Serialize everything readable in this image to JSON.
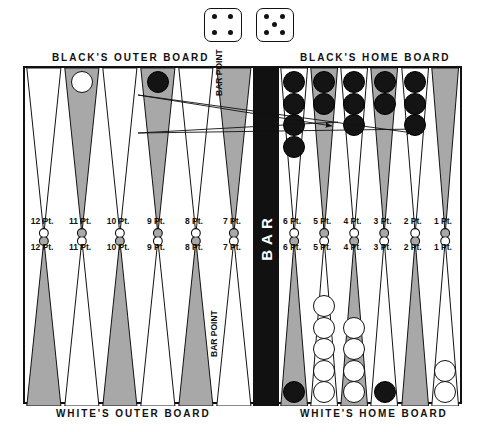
{
  "dice": {
    "name": "dice-pair",
    "die1": {
      "value": 4,
      "label": "4"
    },
    "die2": {
      "value": 5,
      "label": "5"
    }
  },
  "bar": {
    "label": "BAR",
    "color": "#111111"
  },
  "captions": {
    "blacks_outer_board": "BLACK'S OUTER BOARD",
    "blacks_home_board": "BLACK'S HOME BOARD",
    "whites_outer_board": "WHITE'S OUTER BOARD",
    "whites_home_board": "WHITE'S HOME BOARD"
  },
  "bar_point": {
    "top_label": "BAR POINT",
    "bottom_label": "BAR POINT"
  },
  "colors": {
    "board_border": "#111111",
    "shaded_point": "#a8a8a8",
    "plain_point": "#ffffff",
    "black_checker": "#141414",
    "white_checker": "#ffffff",
    "bar": "#111111",
    "arrow": "#111111"
  },
  "top_left_quadrant": {
    "name": "blacks-outer-board",
    "points": [
      {
        "label": "12 Pt.",
        "number": 12,
        "shaded": false,
        "checkers": []
      },
      {
        "label": "11 Pt.",
        "number": 11,
        "shaded": true,
        "checkers": [
          "white"
        ]
      },
      {
        "label": "10 Pt.",
        "number": 10,
        "shaded": false,
        "checkers": []
      },
      {
        "label": "9 Pt.",
        "number": 9,
        "shaded": true,
        "checkers": [
          "black"
        ]
      },
      {
        "label": "8 Pt.",
        "number": 8,
        "shaded": false,
        "checkers": []
      },
      {
        "label": "7 Pt.",
        "number": 7,
        "shaded": true,
        "checkers": []
      }
    ]
  },
  "top_right_quadrant": {
    "name": "blacks-home-board",
    "points": [
      {
        "label": "6 Pt.",
        "number": 6,
        "shaded": false,
        "checkers": [
          "black",
          "black",
          "black",
          "black"
        ]
      },
      {
        "label": "5 Pt.",
        "number": 5,
        "shaded": true,
        "checkers": [
          "black",
          "black"
        ]
      },
      {
        "label": "4 Pt.",
        "number": 4,
        "shaded": false,
        "checkers": [
          "black",
          "black",
          "black"
        ]
      },
      {
        "label": "3 Pt.",
        "number": 3,
        "shaded": true,
        "checkers": [
          "black",
          "black"
        ]
      },
      {
        "label": "2 Pt.",
        "number": 2,
        "shaded": false,
        "checkers": [
          "black",
          "black",
          "black"
        ]
      },
      {
        "label": "1 Pt.",
        "number": 1,
        "shaded": true,
        "checkers": []
      }
    ]
  },
  "bottom_left_quadrant": {
    "name": "whites-outer-board",
    "points": [
      {
        "label": "12 Pt.",
        "number": 12,
        "shaded": true,
        "checkers": []
      },
      {
        "label": "11 Pt.",
        "number": 11,
        "shaded": false,
        "checkers": []
      },
      {
        "label": "10 Pt.",
        "number": 10,
        "shaded": true,
        "checkers": []
      },
      {
        "label": "9 Pt.",
        "number": 9,
        "shaded": false,
        "checkers": []
      },
      {
        "label": "8 Pt.",
        "number": 8,
        "shaded": true,
        "checkers": []
      },
      {
        "label": "7 Pt.",
        "number": 7,
        "shaded": false,
        "checkers": []
      }
    ]
  },
  "bottom_right_quadrant": {
    "name": "whites-home-board",
    "points": [
      {
        "label": "6 Pt.",
        "number": 6,
        "shaded": true,
        "checkers": [
          "black"
        ]
      },
      {
        "label": "5 Pt.",
        "number": 5,
        "shaded": false,
        "checkers": [
          "white",
          "white",
          "white",
          "white",
          "white"
        ]
      },
      {
        "label": "4 Pt.",
        "number": 4,
        "shaded": true,
        "checkers": [
          "white",
          "white",
          "white",
          "white"
        ]
      },
      {
        "label": "3 Pt.",
        "number": 3,
        "shaded": false,
        "checkers": [
          "black"
        ]
      },
      {
        "label": "2 Pt.",
        "number": 2,
        "shaded": true,
        "checkers": []
      },
      {
        "label": "1 Pt.",
        "number": 1,
        "shaded": false,
        "checkers": [
          "white",
          "white"
        ]
      }
    ]
  },
  "arrows": [
    {
      "name": "move-arrow-9pt-to-4pt",
      "from_point": "9 Pt.",
      "to_point": "4 Pt.",
      "die": 5
    },
    {
      "name": "move-arrow-9pt-to-2pt",
      "from_point": "9 Pt.",
      "to_point": "2 Pt.",
      "die": 4
    }
  ]
}
